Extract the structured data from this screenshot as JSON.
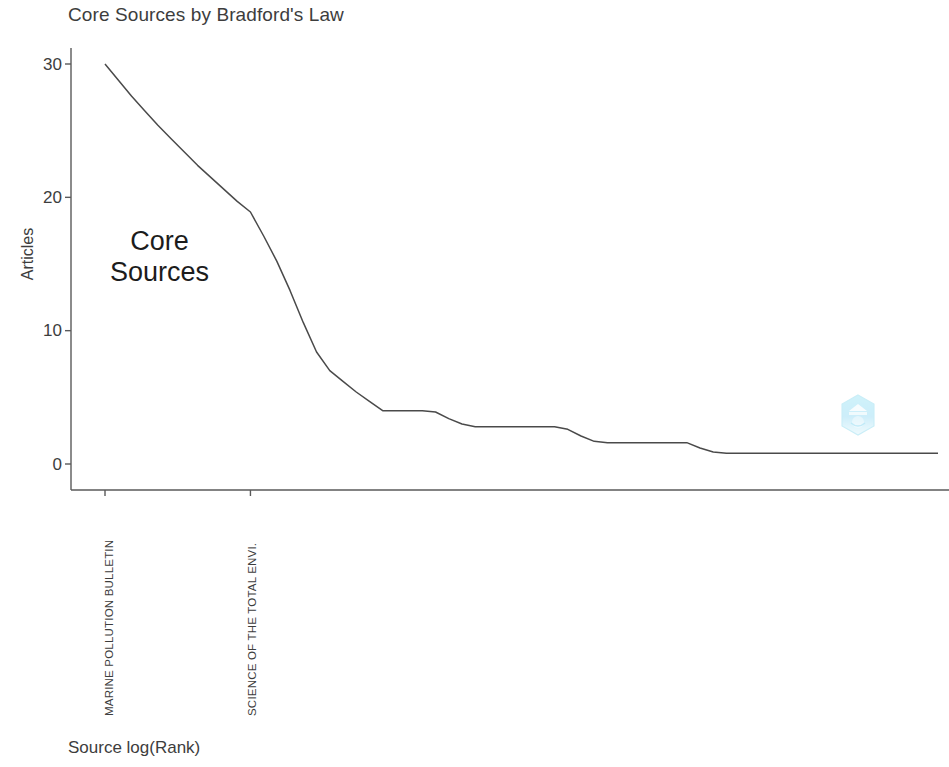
{
  "chart_data": {
    "type": "line",
    "title": "Core Sources by Bradford's Law",
    "xlabel": "Source log(Rank)",
    "ylabel": "Articles",
    "ylim": [
      0,
      31
    ],
    "yticks": [
      0,
      10,
      20,
      30
    ],
    "ytick_labels": [
      "0",
      "10",
      "20",
      "30"
    ],
    "grid": false,
    "legend": null,
    "xtick_labels": [
      "MARINE POLLUTION BULLETIN",
      "SCIENCE OF THE TOTAL ENVI."
    ],
    "xtick_ranks": [
      1,
      12
    ],
    "annotations": [
      {
        "text_line1": "Core",
        "text_line2": "Sources"
      }
    ],
    "series": [
      {
        "name": "Articles per source",
        "x": [
          1,
          2,
          3,
          4,
          5,
          6,
          7,
          8,
          9,
          10,
          11,
          12,
          13,
          14,
          15,
          16,
          17,
          18,
          19,
          20,
          21,
          22,
          23,
          24,
          25,
          26,
          27,
          28,
          29,
          30,
          31,
          32,
          33,
          34,
          35,
          36,
          37,
          38,
          39,
          40,
          41,
          42,
          43,
          44,
          45,
          46,
          47,
          48,
          49,
          50,
          51,
          52,
          53,
          54,
          55,
          56,
          57,
          58,
          59,
          60,
          61,
          62,
          63,
          64
        ],
        "values": [
          30,
          28.8,
          27.6,
          26.5,
          25.4,
          24.4,
          23.4,
          22.4,
          21.5,
          20.6,
          19.7,
          18.9,
          17.1,
          15.2,
          13.0,
          10.6,
          8.4,
          7.0,
          6.2,
          5.4,
          4.7,
          4.0,
          4.0,
          4.0,
          4.0,
          3.9,
          3.4,
          3.0,
          2.8,
          2.8,
          2.8,
          2.8,
          2.8,
          2.8,
          2.8,
          2.6,
          2.1,
          1.7,
          1.6,
          1.6,
          1.6,
          1.6,
          1.6,
          1.6,
          1.6,
          1.2,
          0.9,
          0.8,
          0.8,
          0.8,
          0.8,
          0.8,
          0.8,
          0.8,
          0.8,
          0.8,
          0.8,
          0.8,
          0.8,
          0.8,
          0.8,
          0.8,
          0.8,
          0.8
        ]
      }
    ],
    "line_color": "#4a4a4a",
    "axis_color": "#5a5a5a"
  },
  "watermark": {
    "name": "hexagon-logo-watermark",
    "color": "#5bc8ea"
  }
}
